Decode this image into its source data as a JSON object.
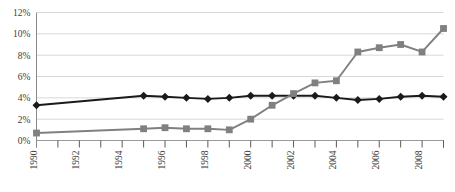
{
  "chart_data": {
    "type": "line",
    "title": "",
    "subtitle": "",
    "xlabel": "",
    "ylabel": "",
    "grid": true,
    "legend_position": "none",
    "x": [
      1990,
      1991,
      1992,
      1993,
      1994,
      1995,
      1996,
      1997,
      1998,
      1999,
      2000,
      2001,
      2002,
      2003,
      2004,
      2005,
      2006,
      2007,
      2008,
      2009
    ],
    "x_tick_labels": [
      "1990",
      "1992",
      "1994",
      "1996",
      "1998",
      "2000",
      "2002",
      "2004",
      "2006",
      "2008"
    ],
    "x_tick_values": [
      1990,
      1992,
      1994,
      1996,
      1998,
      2000,
      2002,
      2004,
      2006,
      2008
    ],
    "xlim": [
      1990,
      2009
    ],
    "y_tick_labels": [
      "0%",
      "2%",
      "4%",
      "6%",
      "8%",
      "10%",
      "12%"
    ],
    "y_tick_values": [
      0,
      2,
      4,
      6,
      8,
      10,
      12
    ],
    "ylim": [
      0,
      12
    ],
    "series": [
      {
        "name": "series-black-diamond",
        "color": "#1a1a1a",
        "marker": "diamond",
        "values": [
          3.3,
          null,
          null,
          null,
          null,
          4.2,
          4.1,
          4.0,
          3.9,
          4.0,
          4.2,
          4.2,
          4.2,
          4.2,
          4.0,
          3.8,
          3.9,
          4.1,
          4.2,
          4.1
        ]
      },
      {
        "name": "series-gray-square",
        "color": "#808080",
        "marker": "square",
        "values": [
          0.7,
          null,
          null,
          null,
          null,
          1.1,
          1.2,
          1.1,
          1.1,
          1.0,
          2.0,
          3.3,
          4.4,
          5.4,
          5.6,
          8.3,
          8.7,
          9.0,
          8.3,
          10.5
        ]
      }
    ]
  }
}
